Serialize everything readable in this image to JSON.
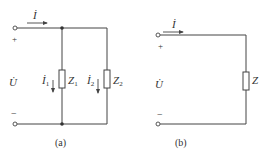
{
  "figure_a": {
    "caption": "(a)",
    "current_total": "İ",
    "current_1": "İ",
    "current_1_sub": "1",
    "current_2": "İ",
    "current_2_sub": "2",
    "voltage": "U̇",
    "plus": "+",
    "minus": "−",
    "impedance_1": "Z",
    "impedance_1_sub": "1",
    "impedance_2": "Z",
    "impedance_2_sub": "2"
  },
  "figure_b": {
    "caption": "(b)",
    "current_total": "İ",
    "voltage": "U̇",
    "plus": "+",
    "minus": "−",
    "impedance": "Z"
  },
  "colors": {
    "wire": "#444444",
    "text": "#333333"
  }
}
